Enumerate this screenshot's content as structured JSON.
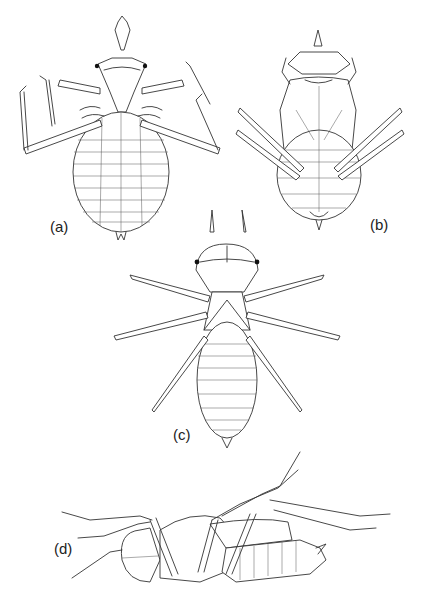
{
  "figure": {
    "panels": [
      {
        "id": "a",
        "label": "(a)",
        "view": "dorsal, spread legs"
      },
      {
        "id": "b",
        "label": "(b)",
        "view": "ventral"
      },
      {
        "id": "c",
        "label": "(c)",
        "view": "dorsal, outstretched legs"
      },
      {
        "id": "d",
        "label": "(d)",
        "view": "lateral"
      }
    ]
  }
}
